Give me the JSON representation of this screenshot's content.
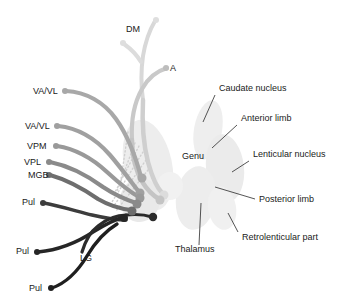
{
  "figure": {
    "background_color": "#ffffff",
    "text_color": "#1a1a1a"
  },
  "nuclei_labels": [
    {
      "id": "dm",
      "text": "DM",
      "x": 126,
      "y": 32,
      "anchor": "start"
    },
    {
      "id": "a",
      "text": "A",
      "x": 170,
      "y": 71,
      "anchor": "start"
    },
    {
      "id": "vavl1",
      "text": "VA/VL",
      "x": 33,
      "y": 94,
      "anchor": "start"
    },
    {
      "id": "vavl2",
      "text": "VA/VL",
      "x": 25,
      "y": 129,
      "anchor": "start"
    },
    {
      "id": "vpm",
      "text": "VPM",
      "x": 27,
      "y": 149,
      "anchor": "start"
    },
    {
      "id": "vpl",
      "text": "VPL",
      "x": 24,
      "y": 165,
      "anchor": "start"
    },
    {
      "id": "mgb",
      "text": "MGB",
      "x": 28,
      "y": 178,
      "anchor": "start"
    },
    {
      "id": "pul1",
      "text": "Pul",
      "x": 22,
      "y": 205,
      "anchor": "start"
    },
    {
      "id": "pul2",
      "text": "Pul",
      "x": 16,
      "y": 254,
      "anchor": "start"
    },
    {
      "id": "lg",
      "text": "LG",
      "x": 80,
      "y": 261,
      "anchor": "start"
    },
    {
      "id": "pul3",
      "text": "Pul",
      "x": 29,
      "y": 291,
      "anchor": "start"
    }
  ],
  "structure_labels": [
    {
      "id": "caudate",
      "text": "Caudate nucleus",
      "x": 219,
      "y": 91,
      "anchor": "start"
    },
    {
      "id": "anterior-limb",
      "text": "Anterior limb",
      "x": 241,
      "y": 121,
      "anchor": "start"
    },
    {
      "id": "genu",
      "text": "Genu",
      "x": 182,
      "y": 159,
      "anchor": "start"
    },
    {
      "id": "lenticular",
      "text": "Lenticular nucleus",
      "x": 253,
      "y": 157,
      "anchor": "start"
    },
    {
      "id": "posterior-limb",
      "text": "Posterior limb",
      "x": 259,
      "y": 202,
      "anchor": "start"
    },
    {
      "id": "retrolenticular",
      "text": "Retrolenticular part",
      "x": 242,
      "y": 240,
      "anchor": "start"
    },
    {
      "id": "thalamus",
      "text": "Thalamus",
      "x": 175,
      "y": 252,
      "anchor": "start"
    }
  ],
  "leader_lines": [
    {
      "id": "caudate-leader",
      "x1": 215,
      "y1": 95,
      "x2": 203,
      "y2": 122
    },
    {
      "id": "anterior-limb-leader",
      "x1": 237,
      "y1": 125,
      "x2": 212,
      "y2": 148
    },
    {
      "id": "lenticular-leader",
      "x1": 249,
      "y1": 161,
      "x2": 232,
      "y2": 172
    },
    {
      "id": "posterior-limb-leader",
      "x1": 255,
      "y1": 199,
      "x2": 215,
      "y2": 187
    },
    {
      "id": "retrolenticular-leader",
      "x1": 238,
      "y1": 232,
      "x2": 228,
      "y2": 213
    },
    {
      "id": "thalamus-leader",
      "x1": 199,
      "y1": 245,
      "x2": 201,
      "y2": 203
    }
  ],
  "fiber_tracts": [
    {
      "id": "tract-dm",
      "color": "#d8d8d8",
      "width": 4.0,
      "path": "M 155 21 C 149 31, 145 44, 143 56 C 141 70, 141 86, 143 100"
    },
    {
      "id": "tract-dm-branch",
      "color": "#dcdcdc",
      "width": 4.0,
      "path": "M 124 44 C 131 49, 137 55, 141 62"
    },
    {
      "id": "tract-a",
      "color": "#c9c9c9",
      "width": 4.2,
      "path": "M 167 68 C 157 71, 148 78, 142 89 C 134 103, 131 122, 132 140"
    },
    {
      "id": "tract-dm-long",
      "color": "#cfcfcf",
      "width": 4.5,
      "path": "M 143 100 C 142 120, 143 143, 148 162 C 152 177, 157 188, 163 194"
    },
    {
      "id": "tract-a-long",
      "color": "#c4c4c4",
      "width": 4.5,
      "path": "M 132 140 C 132 156, 136 172, 143 183 C 148 191, 154 196, 159 199"
    },
    {
      "id": "tract-vavl1",
      "color": "#a8a8a8",
      "width": 4.2,
      "path": "M 66 91 C 86 92, 104 102, 116 119 C 128 136, 136 158, 141 177"
    },
    {
      "id": "tract-vavl2",
      "color": "#a0a0a0",
      "width": 4.2,
      "path": "M 58 126 C 78 128, 96 139, 110 155 C 122 169, 132 183, 139 192"
    },
    {
      "id": "tract-vpm",
      "color": "#999999",
      "width": 4.2,
      "path": "M 57 146 C 76 149, 93 159, 107 172 C 119 183, 130 192, 139 197"
    },
    {
      "id": "tract-vpl",
      "color": "#8a8a8a",
      "width": 4.2,
      "path": "M 50 162 C 70 166, 88 176, 103 187 C 115 195, 127 200, 136 203"
    },
    {
      "id": "tract-mgb",
      "color": "#6e6e6e",
      "width": 4.0,
      "path": "M 50 175 C 68 180, 85 190, 98 199 C 110 206, 122 209, 131 210"
    },
    {
      "id": "tract-pul1",
      "color": "#3c3c3c",
      "width": 3.4,
      "path": "M 44 203 C 60 206, 76 211, 92 215 C 105 218, 117 220, 126 220"
    },
    {
      "id": "tract-pul2",
      "color": "#262626",
      "width": 3.4,
      "path": "M 38 252 C 58 250, 78 242, 93 232 C 106 224, 116 219, 124 217"
    },
    {
      "id": "tract-lg",
      "color": "#2b2b2b",
      "width": 3.2,
      "path": "M 82 252 C 85 242, 90 232, 98 226 C 108 218, 118 215, 126 215"
    },
    {
      "id": "tract-pul3",
      "color": "#1f1f1f",
      "width": 3.4,
      "path": "M 52 288 C 66 283, 78 271, 87 256 C 96 241, 107 230, 117 224"
    },
    {
      "id": "tract-lg-branch",
      "color": "#2b2b2b",
      "width": 3.0,
      "path": "M 126 215 C 136 214, 146 215, 152 217"
    }
  ],
  "tract_bulbs": [
    {
      "id": "bulb-dm",
      "cx": 156,
      "cy": 20,
      "r": 3.0,
      "color": "#dedede"
    },
    {
      "id": "bulb-dm-b",
      "cx": 123,
      "cy": 43,
      "r": 3.0,
      "color": "#dedede"
    },
    {
      "id": "bulb-a",
      "cx": 166,
      "cy": 68,
      "r": 3.0,
      "color": "#bdbdbd"
    },
    {
      "id": "bulb-vavl1",
      "cx": 65,
      "cy": 91,
      "r": 3.0,
      "color": "#a8a8a8"
    },
    {
      "id": "bulb-vavl2",
      "cx": 57,
      "cy": 126,
      "r": 3.0,
      "color": "#a0a0a0"
    },
    {
      "id": "bulb-vpm",
      "cx": 56,
      "cy": 146,
      "r": 3.0,
      "color": "#999999"
    },
    {
      "id": "bulb-vpl",
      "cx": 49,
      "cy": 162,
      "r": 3.0,
      "color": "#8a8a8a"
    },
    {
      "id": "bulb-mgb",
      "cx": 49,
      "cy": 175,
      "r": 3.0,
      "color": "#6e6e6e"
    },
    {
      "id": "bulb-pul1",
      "cx": 43,
      "cy": 203,
      "r": 3.0,
      "color": "#3c3c3c"
    },
    {
      "id": "bulb-pul2",
      "cx": 37,
      "cy": 252,
      "r": 3.0,
      "color": "#262626"
    },
    {
      "id": "bulb-pul3",
      "cx": 51,
      "cy": 288,
      "r": 3.0,
      "color": "#1f1f1f"
    },
    {
      "id": "bulb-end-dm",
      "cx": 164,
      "cy": 195,
      "r": 4.5,
      "color": "#dcdcdc"
    },
    {
      "id": "bulb-end-a",
      "cx": 160,
      "cy": 200,
      "r": 4.5,
      "color": "#c4c4c4"
    },
    {
      "id": "bulb-end-vavl1",
      "cx": 142,
      "cy": 178,
      "r": 4.5,
      "color": "#a8a8a8"
    },
    {
      "id": "bulb-end-vavl2",
      "cx": 140,
      "cy": 193,
      "r": 4.5,
      "color": "#a0a0a0"
    },
    {
      "id": "bulb-end-vpm",
      "cx": 140,
      "cy": 198,
      "r": 4.5,
      "color": "#999999"
    },
    {
      "id": "bulb-end-vpl",
      "cx": 137,
      "cy": 204,
      "r": 4.5,
      "color": "#8a8a8a"
    },
    {
      "id": "bulb-end-mgb",
      "cx": 132,
      "cy": 211,
      "r": 4.5,
      "color": "#6e6e6e"
    },
    {
      "id": "bulb-end-lg",
      "cx": 153,
      "cy": 217,
      "r": 4.2,
      "color": "#2b2b2b"
    },
    {
      "id": "bulb-end-pul",
      "cx": 124,
      "cy": 218,
      "r": 4.0,
      "color": "#262626"
    }
  ],
  "anatomy_blobs": [
    {
      "id": "blob-thalamus-left",
      "cx": 148,
      "cy": 165,
      "rx": 24,
      "ry": 46,
      "rot": -12,
      "color": "#ededed"
    },
    {
      "id": "blob-lentiform-left",
      "cx": 140,
      "cy": 200,
      "rx": 20,
      "ry": 22,
      "rot": 10,
      "color": "#e9e9e9"
    },
    {
      "id": "blob-caudate-right",
      "cx": 208,
      "cy": 130,
      "rx": 14,
      "ry": 30,
      "rot": 10,
      "color": "#eeeeee"
    },
    {
      "id": "blob-lenticular",
      "cx": 225,
      "cy": 168,
      "rx": 19,
      "ry": 34,
      "rot": -6,
      "color": "#ebebeb"
    },
    {
      "id": "blob-thalamus-right",
      "cx": 196,
      "cy": 198,
      "rx": 20,
      "ry": 32,
      "rot": 8,
      "color": "#ededed"
    },
    {
      "id": "blob-retro",
      "cx": 222,
      "cy": 208,
      "rx": 14,
      "ry": 22,
      "rot": -10,
      "color": "#f0f0f0"
    },
    {
      "id": "blob-genu-bridge",
      "cx": 170,
      "cy": 186,
      "rx": 13,
      "ry": 14,
      "rot": 0,
      "color": "#f1f1f1"
    }
  ],
  "dotted_rays": [
    {
      "id": "ray-1",
      "x1": 135,
      "y1": 143,
      "x2": 117,
      "y2": 191
    },
    {
      "id": "ray-2",
      "x1": 139,
      "y1": 146,
      "x2": 113,
      "y2": 196
    },
    {
      "id": "ray-3",
      "x1": 143,
      "y1": 152,
      "x2": 112,
      "y2": 202
    },
    {
      "id": "ray-4",
      "x1": 146,
      "y1": 160,
      "x2": 113,
      "y2": 207
    },
    {
      "id": "ray-5",
      "x1": 148,
      "y1": 170,
      "x2": 116,
      "y2": 211
    },
    {
      "id": "ray-6",
      "x1": 128,
      "y1": 132,
      "x2": 120,
      "y2": 186
    }
  ]
}
